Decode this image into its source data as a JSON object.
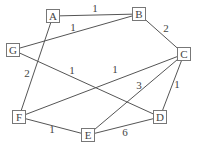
{
  "graph": {
    "nodes": [
      {
        "id": "A",
        "label": "A",
        "x": 53,
        "y": 16
      },
      {
        "id": "B",
        "label": "B",
        "x": 139,
        "y": 14
      },
      {
        "id": "C",
        "label": "C",
        "x": 184,
        "y": 54
      },
      {
        "id": "G",
        "label": "G",
        "x": 13,
        "y": 50
      },
      {
        "id": "F",
        "label": "F",
        "x": 19,
        "y": 117
      },
      {
        "id": "E",
        "label": "E",
        "x": 88,
        "y": 135
      },
      {
        "id": "D",
        "label": "D",
        "x": 160,
        "y": 117
      }
    ],
    "edges": [
      {
        "from": "A",
        "to": "B",
        "weight": "1",
        "lx": 95,
        "ly": 12
      },
      {
        "from": "G",
        "to": "B",
        "weight": "1",
        "lx": 73,
        "ly": 31
      },
      {
        "from": "B",
        "to": "C",
        "weight": "2",
        "lx": 166,
        "ly": 32
      },
      {
        "from": "A",
        "to": "F",
        "weight": "2",
        "lx": 27,
        "ly": 77
      },
      {
        "from": "G",
        "to": "D",
        "weight": "1",
        "lx": 72,
        "ly": 74
      },
      {
        "from": "F",
        "to": "C",
        "weight": "1",
        "lx": 115,
        "ly": 73
      },
      {
        "from": "E",
        "to": "C",
        "weight": "3",
        "lx": 139,
        "ly": 89
      },
      {
        "from": "D",
        "to": "C",
        "weight": "1",
        "lx": 177,
        "ly": 88
      },
      {
        "from": "F",
        "to": "E",
        "weight": "1",
        "lx": 52,
        "ly": 133
      },
      {
        "from": "E",
        "to": "D",
        "weight": "6",
        "lx": 125,
        "ly": 136
      }
    ]
  }
}
